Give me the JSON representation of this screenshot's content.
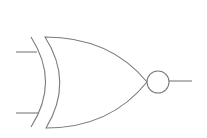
{
  "diagram": {
    "type": "logic-gate",
    "gate": "XNOR",
    "colors": {
      "background": "#ffffff",
      "stroke": "#7a7a7a"
    },
    "stroke_width": 1.1,
    "inputs": [
      {
        "name": "input-a",
        "x1": 16,
        "y1": 52,
        "x2": 37,
        "y2": 52
      },
      {
        "name": "input-b",
        "x1": 16,
        "y1": 113,
        "x2": 38,
        "y2": 113
      }
    ],
    "output": {
      "x1": 169,
      "y1": 81,
      "x2": 192,
      "y2": 81
    },
    "bubble": {
      "cx": 158,
      "cy": 82,
      "r": 11
    },
    "extra_arc": "M 31 37 Q 60 82 31 127",
    "body": "M 45 37 Q 110 37 147 82 Q 110 128 46 128 Q 74 82 45 37 Z"
  }
}
